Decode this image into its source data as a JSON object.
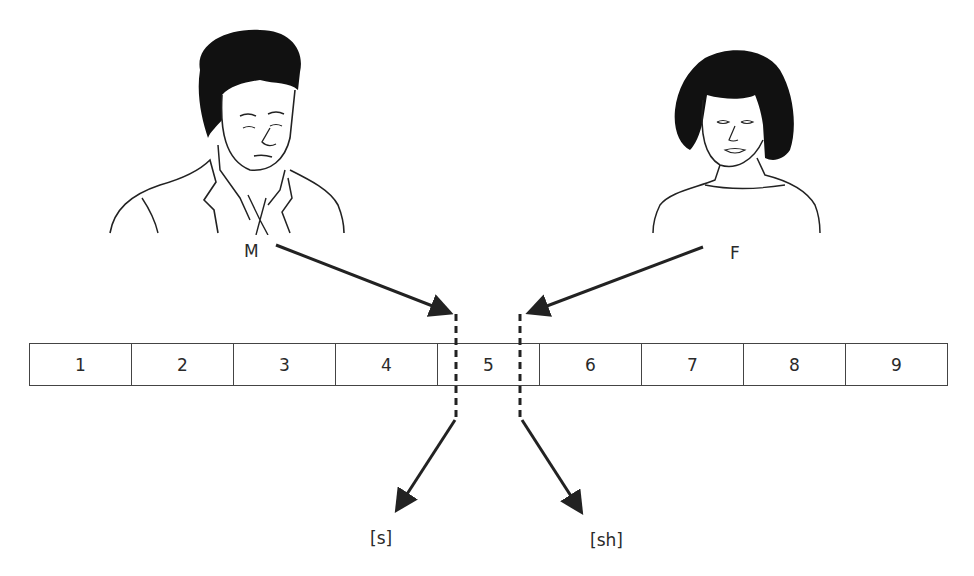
{
  "figures": {
    "male": {
      "label": "M",
      "description": "man in suit and tie"
    },
    "female": {
      "label": "F",
      "description": "woman with bob haircut"
    }
  },
  "continuum": {
    "cells": [
      "1",
      "2",
      "3",
      "4",
      "5",
      "6",
      "7",
      "8",
      "9"
    ]
  },
  "boundaries": {
    "male_boundary_between": [
      "4",
      "5"
    ],
    "female_boundary_between": [
      "5",
      "6"
    ]
  },
  "outputs": {
    "left": "[s]",
    "right": "[sh]"
  },
  "colors": {
    "line": "#222222",
    "hair": "#111111",
    "box_border": "#444444"
  }
}
